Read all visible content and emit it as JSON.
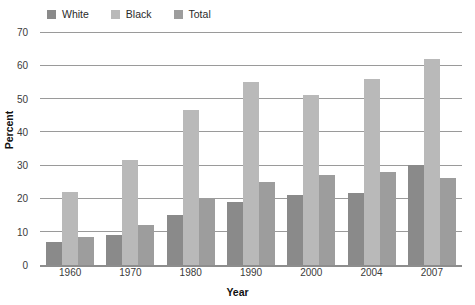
{
  "legend": {
    "position": "top-left",
    "entries": [
      {
        "label": "White",
        "color": "#8a8a8a",
        "swatch_name": "legend-swatch-white"
      },
      {
        "label": "Black",
        "color": "#b9b9b9",
        "swatch_name": "legend-swatch-black"
      },
      {
        "label": "Total",
        "color": "#9d9d9d",
        "swatch_name": "legend-swatch-total"
      }
    ]
  },
  "axes": {
    "y_title": "Percent",
    "x_title": "Year",
    "y_ticks": [
      "0",
      "10",
      "20",
      "30",
      "40",
      "50",
      "60",
      "70"
    ]
  },
  "chart_data": {
    "type": "bar",
    "title": "",
    "subtitle": "",
    "xlabel": "Year",
    "ylabel": "Percent",
    "categories": [
      "1960",
      "1970",
      "1980",
      "1990",
      "2000",
      "2004",
      "2007"
    ],
    "series": [
      {
        "name": "White",
        "color": "#8a8a8a",
        "values": [
          7,
          9,
          15,
          19,
          21,
          21.5,
          30
        ]
      },
      {
        "name": "Black",
        "color": "#b9b9b9",
        "values": [
          22,
          31.5,
          46.5,
          55,
          51,
          56,
          62
        ]
      },
      {
        "name": "Total",
        "color": "#9d9d9d",
        "values": [
          8.5,
          12,
          20,
          25,
          27,
          28,
          26
        ]
      }
    ],
    "ylim": [
      0,
      70
    ],
    "ytick_step": 10,
    "grid": true,
    "grid_axis": "y",
    "legend_position": "top-left"
  }
}
